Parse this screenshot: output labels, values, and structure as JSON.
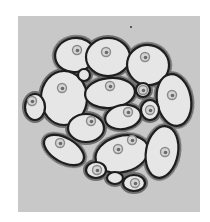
{
  "figure": {
    "type": "micrograph",
    "colors": {
      "page_background": "#ffffff",
      "field_background": "#c8c8c8",
      "cell_fill": "#e6e6e6",
      "cell_outline": "#1e1e1e",
      "interstitial": "#6e6e6e",
      "nucleus": "#8a8a8a"
    },
    "field": {
      "x": 18,
      "y": 16,
      "width": 182,
      "height": 196
    },
    "cells": [
      {
        "id": "top-left",
        "cx": 75,
        "cy": 55,
        "rx": 20,
        "ry": 17,
        "rot": -10,
        "nuclei": [
          [
            77,
            50
          ]
        ]
      },
      {
        "id": "top-center",
        "cx": 108,
        "cy": 57,
        "rx": 22,
        "ry": 19,
        "rot": 0,
        "nuclei": [
          [
            106,
            52
          ]
        ]
      },
      {
        "id": "top-right",
        "cx": 148,
        "cy": 65,
        "rx": 21,
        "ry": 20,
        "rot": 10,
        "nuclei": [
          [
            145,
            57
          ]
        ]
      },
      {
        "id": "left-large",
        "cx": 64,
        "cy": 98,
        "rx": 23,
        "ry": 27,
        "rot": 0,
        "nuclei": [
          [
            62,
            88
          ]
        ]
      },
      {
        "id": "center-upper",
        "cx": 110,
        "cy": 93,
        "rx": 25,
        "ry": 15,
        "rot": -5,
        "nuclei": [
          [
            110,
            86
          ]
        ]
      },
      {
        "id": "right-tall",
        "cx": 174,
        "cy": 100,
        "rx": 17,
        "ry": 26,
        "rot": -10,
        "nuclei": [
          [
            172,
            95
          ]
        ]
      },
      {
        "id": "left-edge",
        "cx": 35,
        "cy": 107,
        "rx": 10,
        "ry": 13,
        "rot": 0,
        "nuclei": [
          [
            32,
            101
          ]
        ]
      },
      {
        "id": "center-mid",
        "cx": 123,
        "cy": 117,
        "rx": 18,
        "ry": 12,
        "rot": -10,
        "nuclei": [
          [
            128,
            112
          ]
        ]
      },
      {
        "id": "left-mid",
        "cx": 86,
        "cy": 128,
        "rx": 18,
        "ry": 14,
        "rot": 0,
        "nuclei": [
          [
            91,
            121
          ]
        ]
      },
      {
        "id": "lower-left",
        "cx": 64,
        "cy": 150,
        "rx": 22,
        "ry": 12,
        "rot": 30,
        "nuclei": [
          [
            60,
            143
          ]
        ]
      },
      {
        "id": "lower-center",
        "cx": 122,
        "cy": 154,
        "rx": 27,
        "ry": 18,
        "rot": -15,
        "nuclei": [
          [
            118,
            149
          ],
          [
            132,
            140
          ]
        ]
      },
      {
        "id": "lower-right",
        "cx": 162,
        "cy": 152,
        "rx": 16,
        "ry": 26,
        "rot": 10,
        "nuclei": [
          [
            165,
            152
          ]
        ]
      },
      {
        "id": "bottom-a",
        "cx": 96,
        "cy": 170,
        "rx": 10,
        "ry": 8,
        "rot": 0,
        "nuclei": [
          [
            97,
            170
          ]
        ]
      },
      {
        "id": "bottom-b",
        "cx": 115,
        "cy": 178,
        "rx": 8,
        "ry": 6,
        "rot": 0,
        "nuclei": []
      },
      {
        "id": "bottom-c",
        "cx": 134,
        "cy": 183,
        "rx": 11,
        "ry": 8,
        "rot": 0,
        "nuclei": [
          [
            135,
            183
          ]
        ]
      },
      {
        "id": "inner-small-a",
        "cx": 143,
        "cy": 90,
        "rx": 7,
        "ry": 7,
        "rot": 0,
        "nuclei": [
          [
            143,
            90
          ]
        ]
      },
      {
        "id": "inner-small-b",
        "cx": 150,
        "cy": 110,
        "rx": 9,
        "ry": 10,
        "rot": 0,
        "nuclei": [
          [
            150,
            110
          ]
        ]
      },
      {
        "id": "inner-small-c",
        "cx": 84,
        "cy": 75,
        "rx": 6,
        "ry": 6,
        "rot": 0,
        "nuclei": []
      }
    ],
    "speck": {
      "x": 131,
      "y": 27
    }
  }
}
